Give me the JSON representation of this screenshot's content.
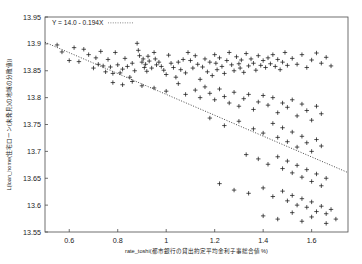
{
  "chart_data": {
    "type": "scatter",
    "title": "",
    "xlabel": "rate_toshi(都市銀行の貸出約定平均金利子事総合値  %)",
    "ylabel": "L(loan_home(住宅ローン(未発見)の地域の分散値))",
    "xlim": [
      0.5,
      1.75
    ],
    "ylim": [
      13.55,
      13.95
    ],
    "xticks": [
      "0.6",
      "0.8",
      "1",
      "1.2",
      "1.4",
      "1.6"
    ],
    "xtick_values": [
      0.6,
      0.8,
      1.0,
      1.2,
      1.4,
      1.6
    ],
    "yticks": [
      "13.95",
      "13.9",
      "13.85",
      "13.8",
      "13.75",
      "13.7",
      "13.65",
      "13.6",
      "13.55"
    ],
    "ytick_values": [
      13.95,
      13.9,
      13.85,
      13.8,
      13.75,
      13.7,
      13.65,
      13.6,
      13.55
    ],
    "grid": false,
    "legend": "none",
    "marker": "plus",
    "annotation": "Y = 14.0 - 0.194X",
    "fit": {
      "type": "line",
      "style": "dotted",
      "intercept": 14.0,
      "slope": -0.194,
      "x_start": 0.5,
      "x_end": 1.75
    },
    "points": [
      [
        0.55,
        13.898
      ],
      [
        0.57,
        13.885
      ],
      [
        0.6,
        13.869
      ],
      [
        0.62,
        13.893
      ],
      [
        0.64,
        13.867
      ],
      [
        0.66,
        13.89
      ],
      [
        0.68,
        13.88
      ],
      [
        0.7,
        13.855
      ],
      [
        0.71,
        13.874
      ],
      [
        0.72,
        13.862
      ],
      [
        0.73,
        13.886
      ],
      [
        0.74,
        13.859
      ],
      [
        0.75,
        13.848
      ],
      [
        0.76,
        13.871
      ],
      [
        0.77,
        13.857
      ],
      [
        0.78,
        13.845
      ],
      [
        0.79,
        13.884
      ],
      [
        0.8,
        13.861
      ],
      [
        0.81,
        13.846
      ],
      [
        0.82,
        13.853
      ],
      [
        0.83,
        13.873
      ],
      [
        0.84,
        13.858
      ],
      [
        0.85,
        13.838
      ],
      [
        0.86,
        13.864
      ],
      [
        0.87,
        13.85
      ],
      [
        0.88,
        13.901
      ],
      [
        0.885,
        13.888
      ],
      [
        0.89,
        13.878
      ],
      [
        0.9,
        13.866
      ],
      [
        0.905,
        13.872
      ],
      [
        0.91,
        13.856
      ],
      [
        0.915,
        13.862
      ],
      [
        0.92,
        13.849
      ],
      [
        0.925,
        13.877
      ],
      [
        0.93,
        13.868
      ],
      [
        0.94,
        13.855
      ],
      [
        0.95,
        13.884
      ],
      [
        0.955,
        13.872
      ],
      [
        0.96,
        13.861
      ],
      [
        0.97,
        13.866
      ],
      [
        0.98,
        13.858
      ],
      [
        0.99,
        13.851
      ],
      [
        1.0,
        13.843
      ],
      [
        1.01,
        13.879
      ],
      [
        1.02,
        13.864
      ],
      [
        1.03,
        13.856
      ],
      [
        1.04,
        13.838
      ],
      [
        1.05,
        13.866
      ],
      [
        1.06,
        13.852
      ],
      [
        1.07,
        13.871
      ],
      [
        1.08,
        13.846
      ],
      [
        1.09,
        13.884
      ],
      [
        1.1,
        13.869
      ],
      [
        1.11,
        13.855
      ],
      [
        1.12,
        13.878
      ],
      [
        1.13,
        13.862
      ],
      [
        1.14,
        13.834
      ],
      [
        1.15,
        13.857
      ],
      [
        1.16,
        13.872
      ],
      [
        1.17,
        13.848
      ],
      [
        1.18,
        13.866
      ],
      [
        1.19,
        13.841
      ],
      [
        1.2,
        13.88
      ],
      [
        1.205,
        13.864
      ],
      [
        1.21,
        13.852
      ],
      [
        1.22,
        13.874
      ],
      [
        1.23,
        13.858
      ],
      [
        1.24,
        13.845
      ],
      [
        1.25,
        13.869
      ],
      [
        1.26,
        13.884
      ],
      [
        1.27,
        13.861
      ],
      [
        1.28,
        13.85
      ],
      [
        1.29,
        13.876
      ],
      [
        1.3,
        13.863
      ],
      [
        1.305,
        13.855
      ],
      [
        1.31,
        13.87
      ],
      [
        1.32,
        13.847
      ],
      [
        1.33,
        13.882
      ],
      [
        1.34,
        13.859
      ],
      [
        1.35,
        13.872
      ],
      [
        1.36,
        13.864
      ],
      [
        1.37,
        13.851
      ],
      [
        1.38,
        13.878
      ],
      [
        1.39,
        13.86
      ],
      [
        1.4,
        13.869
      ],
      [
        1.41,
        13.856
      ],
      [
        1.42,
        13.874
      ],
      [
        1.43,
        13.863
      ],
      [
        1.44,
        13.88
      ],
      [
        1.45,
        13.858
      ],
      [
        1.46,
        13.871
      ],
      [
        1.47,
        13.852
      ],
      [
        1.48,
        13.866
      ],
      [
        1.49,
        13.884
      ],
      [
        1.5,
        13.86
      ],
      [
        1.52,
        13.873
      ],
      [
        1.54,
        13.862
      ],
      [
        1.56,
        13.88
      ],
      [
        1.58,
        13.856
      ],
      [
        1.6,
        13.87
      ],
      [
        1.62,
        13.883
      ],
      [
        1.64,
        13.864
      ],
      [
        1.66,
        13.875
      ],
      [
        1.68,
        13.859
      ],
      [
        0.78,
        13.828
      ],
      [
        0.82,
        13.824
      ],
      [
        0.86,
        13.83
      ],
      [
        0.9,
        13.822
      ],
      [
        0.95,
        13.818
      ],
      [
        1.0,
        13.812
      ],
      [
        1.05,
        13.826
      ],
      [
        1.08,
        13.806
      ],
      [
        1.12,
        13.814
      ],
      [
        1.14,
        13.8
      ],
      [
        1.16,
        13.82
      ],
      [
        1.18,
        13.808
      ],
      [
        1.2,
        13.796
      ],
      [
        1.22,
        13.816
      ],
      [
        1.24,
        13.802
      ],
      [
        1.26,
        13.79
      ],
      [
        1.28,
        13.81
      ],
      [
        1.3,
        13.784
      ],
      [
        1.32,
        13.798
      ],
      [
        1.34,
        13.806
      ],
      [
        1.36,
        13.778
      ],
      [
        1.38,
        13.792
      ],
      [
        1.4,
        13.804
      ],
      [
        1.42,
        13.786
      ],
      [
        1.44,
        13.8
      ],
      [
        1.46,
        13.772
      ],
      [
        1.48,
        13.79
      ],
      [
        1.5,
        13.782
      ],
      [
        1.52,
        13.796
      ],
      [
        1.54,
        13.766
      ],
      [
        1.56,
        13.788
      ],
      [
        1.58,
        13.776
      ],
      [
        1.6,
        13.758
      ],
      [
        1.62,
        13.784
      ],
      [
        1.64,
        13.77
      ],
      [
        1.18,
        13.762
      ],
      [
        1.24,
        13.748
      ],
      [
        1.3,
        13.756
      ],
      [
        1.36,
        13.742
      ],
      [
        1.4,
        13.734
      ],
      [
        1.44,
        13.752
      ],
      [
        1.46,
        13.726
      ],
      [
        1.48,
        13.744
      ],
      [
        1.5,
        13.718
      ],
      [
        1.52,
        13.736
      ],
      [
        1.54,
        13.708
      ],
      [
        1.56,
        13.728
      ],
      [
        1.58,
        13.716
      ],
      [
        1.6,
        13.7
      ],
      [
        1.62,
        13.722
      ],
      [
        1.64,
        13.71
      ],
      [
        1.33,
        13.694
      ],
      [
        1.38,
        13.686
      ],
      [
        1.42,
        13.676
      ],
      [
        1.46,
        13.69
      ],
      [
        1.48,
        13.668
      ],
      [
        1.5,
        13.682
      ],
      [
        1.52,
        13.66
      ],
      [
        1.54,
        13.674
      ],
      [
        1.56,
        13.652
      ],
      [
        1.58,
        13.666
      ],
      [
        1.6,
        13.644
      ],
      [
        1.62,
        13.658
      ],
      [
        1.64,
        13.636
      ],
      [
        1.66,
        13.65
      ],
      [
        1.22,
        13.64
      ],
      [
        1.28,
        13.628
      ],
      [
        1.34,
        13.622
      ],
      [
        1.4,
        13.632
      ],
      [
        1.44,
        13.616
      ],
      [
        1.48,
        13.626
      ],
      [
        1.5,
        13.608
      ],
      [
        1.52,
        13.618
      ],
      [
        1.54,
        13.6
      ],
      [
        1.56,
        13.612
      ],
      [
        1.58,
        13.596
      ],
      [
        1.6,
        13.606
      ],
      [
        1.62,
        13.588
      ],
      [
        1.64,
        13.598
      ],
      [
        1.66,
        13.584
      ],
      [
        1.68,
        13.592
      ],
      [
        1.4,
        13.58
      ],
      [
        1.46,
        13.574
      ],
      [
        1.52,
        13.586
      ],
      [
        1.56,
        13.57
      ],
      [
        1.6,
        13.578
      ],
      [
        1.66,
        13.566
      ],
      [
        1.7,
        13.574
      ]
    ]
  }
}
